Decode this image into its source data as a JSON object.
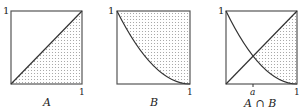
{
  "panels": [
    {
      "id": "A",
      "caption": "A",
      "y_axis_label": "1",
      "x_axis_label": "1",
      "curve": "diagonal y = x",
      "shaded_region": "below diagonal"
    },
    {
      "id": "B",
      "caption": "B",
      "y_axis_label": "1",
      "x_axis_label": "1",
      "curve": "y = (1 - x)^2",
      "shaded_region": "above curve"
    },
    {
      "id": "AnB",
      "caption": "A ∩ B",
      "y_axis_label": "1",
      "x_axis_label": "1",
      "x_marker_label": "a",
      "curves": [
        "y = x",
        "y = (1 - x)^2"
      ],
      "shaded_region": "below diagonal and above curve, x > a"
    }
  ],
  "colors": {
    "line": "#333333",
    "frame": "#555555",
    "dots": "#9a9a9a"
  }
}
